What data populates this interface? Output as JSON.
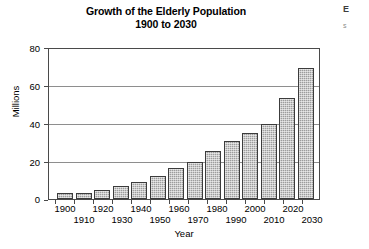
{
  "chart_data": {
    "type": "bar",
    "title": "Growth of the Elderly Population",
    "subtitle": "1900 to 2030",
    "xlabel": "Year",
    "ylabel": "Millions",
    "ylim": [
      0,
      80
    ],
    "yticks": [
      0,
      20,
      40,
      60,
      80
    ],
    "grid": true,
    "legend": "none",
    "categories": [
      "1900",
      "1910",
      "1920",
      "1930",
      "1940",
      "1950",
      "1960",
      "1970",
      "1980",
      "1990",
      "2000",
      "2010",
      "2020",
      "2030"
    ],
    "values": [
      3.1,
      3.1,
      4.9,
      6.7,
      9.0,
      12.3,
      16.6,
      20.0,
      25.5,
      31.2,
      35.0,
      40.1,
      53.7,
      70.0
    ],
    "series": [
      {
        "name": "Elderly population (millions)",
        "values": [
          3.1,
          3.1,
          4.9,
          6.7,
          9.0,
          12.3,
          16.6,
          20.0,
          25.5,
          31.2,
          35.0,
          40.1,
          53.7,
          70.0
        ]
      }
    ],
    "bar_color": "#9d9d9d",
    "bar_border_color": "#3c3c3c",
    "axis_color": "#4a4a4a",
    "grid_color": "#8e8e8e"
  },
  "edge_bleed": {
    "line1": "E",
    "line2": "s"
  }
}
